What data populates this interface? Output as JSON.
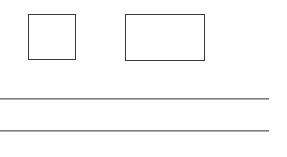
{
  "canvas": {
    "width": 287,
    "height": 157,
    "background": "#ffffff"
  },
  "shapes": [
    {
      "id": "square-box",
      "type": "rect",
      "x": 28,
      "y": 14,
      "w": 48,
      "h": 46,
      "stroke": "#3a3a3a"
    },
    {
      "id": "wide-box",
      "type": "rect",
      "x": 125,
      "y": 14,
      "w": 80,
      "h": 47,
      "stroke": "#3a3a3a"
    }
  ],
  "lines": [
    {
      "id": "rule-1",
      "x1": 0,
      "x2": 269,
      "y": 98,
      "stroke": "#7a7a7a"
    },
    {
      "id": "rule-2",
      "x1": 0,
      "x2": 269,
      "y": 130,
      "stroke": "#7a7a7a"
    }
  ]
}
